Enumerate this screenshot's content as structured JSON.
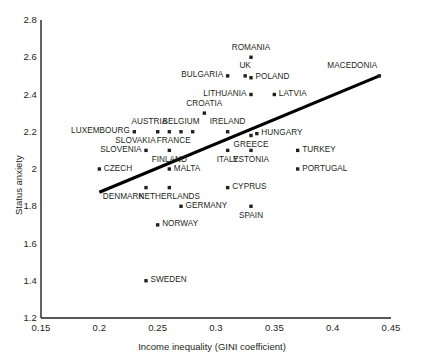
{
  "chart_data": {
    "type": "scatter",
    "title": "",
    "xlabel": "Income inequality (GINI coefficient)",
    "ylabel": "Status anxiety",
    "xlim": [
      0.15,
      0.45
    ],
    "ylim": [
      1.2,
      2.8
    ],
    "xticks": [
      "0.15",
      "0.2",
      "0.25",
      "0.3",
      "0.35",
      "0.4",
      "0.45"
    ],
    "xtick_values": [
      0.15,
      0.2,
      0.25,
      0.3,
      0.35,
      0.4,
      0.45
    ],
    "yticks": [
      "1.2",
      "1.4",
      "1.6",
      "1.8",
      "2",
      "2.2",
      "2.4",
      "2.6",
      "2.8"
    ],
    "ytick_values": [
      1.2,
      1.4,
      1.6,
      1.8,
      2.0,
      2.2,
      2.4,
      2.6,
      2.8
    ],
    "grid": false,
    "legend": null,
    "marker_color": "#231f20",
    "trendline": {
      "x": [
        0.2,
        0.44
      ],
      "y": [
        1.875,
        2.5
      ],
      "color": "#000000",
      "width": 3.2
    },
    "points": [
      {
        "name": "ROMANIA",
        "x": 0.33,
        "y": 2.6,
        "label_pos": "above"
      },
      {
        "name": "MACEDONIA",
        "x": 0.44,
        "y": 2.5,
        "label_pos": "above-left"
      },
      {
        "name": "BULGARIA",
        "x": 0.31,
        "y": 2.5,
        "label_pos": "left"
      },
      {
        "name": "UK",
        "x": 0.325,
        "y": 2.5,
        "label_pos": "above"
      },
      {
        "name": "POLAND",
        "x": 0.33,
        "y": 2.49,
        "label_pos": "right"
      },
      {
        "name": "LITHUANIA",
        "x": 0.33,
        "y": 2.4,
        "label_pos": "left"
      },
      {
        "name": "LATVIA",
        "x": 0.35,
        "y": 2.4,
        "label_pos": "right"
      },
      {
        "name": "CROATIA",
        "x": 0.29,
        "y": 2.3,
        "label_pos": "above"
      },
      {
        "name": "AUSTRIA",
        "x": 0.26,
        "y": 2.2,
        "label_pos": "above-left"
      },
      {
        "name": "LUXEMBOURG",
        "x": 0.23,
        "y": 2.2,
        "label_pos": "left"
      },
      {
        "name": "SLOVAKIA",
        "x": 0.25,
        "y": 2.2,
        "label_pos": "below-left"
      },
      {
        "name": "BELGIUM",
        "x": 0.27,
        "y": 2.2,
        "label_pos": "above"
      },
      {
        "name": "FRANCE",
        "x": 0.28,
        "y": 2.2,
        "label_pos": "below-left"
      },
      {
        "name": "IRELAND",
        "x": 0.31,
        "y": 2.2,
        "label_pos": "above"
      },
      {
        "name": "HUNGARY",
        "x": 0.335,
        "y": 2.19,
        "label_pos": "right"
      },
      {
        "name": "GREECE",
        "x": 0.33,
        "y": 2.18,
        "label_pos": "below"
      },
      {
        "name": "SLOVENIA",
        "x": 0.24,
        "y": 2.1,
        "label_pos": "left"
      },
      {
        "name": "FINLAND",
        "x": 0.26,
        "y": 2.1,
        "label_pos": "below"
      },
      {
        "name": "ITALY",
        "x": 0.31,
        "y": 2.1,
        "label_pos": "below"
      },
      {
        "name": "ESTONIA",
        "x": 0.33,
        "y": 2.1,
        "label_pos": "below"
      },
      {
        "name": "TURKEY",
        "x": 0.37,
        "y": 2.1,
        "label_pos": "right"
      },
      {
        "name": "CZECH",
        "x": 0.2,
        "y": 2.0,
        "label_pos": "right"
      },
      {
        "name": "MALTA",
        "x": 0.26,
        "y": 2.0,
        "label_pos": "right"
      },
      {
        "name": "PORTUGAL",
        "x": 0.37,
        "y": 2.0,
        "label_pos": "right"
      },
      {
        "name": "DENMARK",
        "x": 0.24,
        "y": 1.9,
        "label_pos": "below-left"
      },
      {
        "name": "NETHERLANDS",
        "x": 0.26,
        "y": 1.9,
        "label_pos": "below"
      },
      {
        "name": "CYPRUS",
        "x": 0.31,
        "y": 1.9,
        "label_pos": "right"
      },
      {
        "name": "GERMANY",
        "x": 0.27,
        "y": 1.8,
        "label_pos": "right"
      },
      {
        "name": "SPAIN",
        "x": 0.33,
        "y": 1.8,
        "label_pos": "below"
      },
      {
        "name": "NORWAY",
        "x": 0.25,
        "y": 1.7,
        "label_pos": "right"
      },
      {
        "name": "SWEDEN",
        "x": 0.24,
        "y": 1.4,
        "label_pos": "right"
      }
    ]
  }
}
